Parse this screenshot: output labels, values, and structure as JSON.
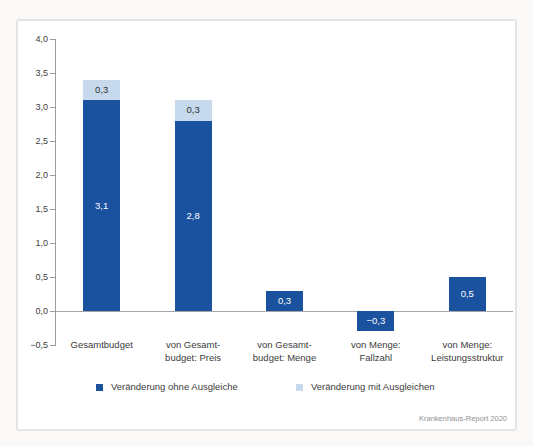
{
  "chart_data": {
    "type": "bar",
    "stacked": true,
    "grid": false,
    "legend_position": "bottom",
    "ylim": [
      -0.5,
      4.0
    ],
    "y_ticks": {
      "values": [
        4.0,
        3.5,
        3.0,
        2.5,
        2.0,
        1.5,
        1.0,
        0.5,
        0.0,
        -0.5
      ],
      "labels": [
        "4,0",
        "3,5",
        "3,0",
        "2,5",
        "2,0",
        "1,5",
        "1,0",
        "0,5",
        "0,0",
        "−0,5"
      ]
    },
    "categories": [
      [
        "Gesamtbudget"
      ],
      [
        "von Gesamt-",
        "budget: Preis"
      ],
      [
        "von Gesamt-",
        "budget: Menge"
      ],
      [
        "von Menge:",
        "Fallzahl"
      ],
      [
        "von Menge:",
        "Leistungsstruktur"
      ]
    ],
    "series": [
      {
        "name": "Veränderung ohne Ausgleiche",
        "color": "#1b529f",
        "label_color": "#ffffff",
        "values": [
          3.1,
          2.8,
          0.3,
          -0.3,
          0.5
        ],
        "labels": [
          "3,1",
          "2,8",
          "0,3",
          "−0,3",
          "0,5"
        ]
      },
      {
        "name": "Veränderung mit Ausgleichen",
        "color": "#c7d9ec",
        "label_color": "#2f2f2f",
        "values": [
          0.3,
          0.3,
          null,
          null,
          null
        ],
        "labels": [
          "0,3",
          "0,3",
          "",
          "",
          ""
        ]
      }
    ]
  },
  "colors": {
    "axis": "#9c9c9c",
    "frame_border": "#e5e5e6",
    "background": "#ffffff"
  },
  "source": "Krankenhaus-Report 2020"
}
